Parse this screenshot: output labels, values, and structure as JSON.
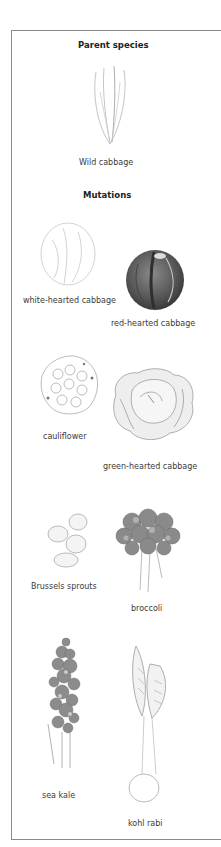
{
  "sections": {
    "parent_heading": "Parent species",
    "mutations_heading": "Mutations"
  },
  "parent": {
    "label": "Wild cabbage",
    "icon": "wild-cabbage-illustration"
  },
  "mutations": [
    {
      "label": "white-hearted cabbage",
      "icon": "white-cabbage-illustration"
    },
    {
      "label": "red-hearted cabbage",
      "icon": "red-cabbage-illustration"
    },
    {
      "label": "cauliflower",
      "icon": "cauliflower-illustration"
    },
    {
      "label": "green-hearted cabbage",
      "icon": "green-cabbage-illustration"
    },
    {
      "label": "Brussels sprouts",
      "icon": "brussels-sprouts-illustration"
    },
    {
      "label": "broccoli",
      "icon": "broccoli-illustration"
    },
    {
      "label": "sea kale",
      "icon": "sea-kale-illustration"
    },
    {
      "label": "kohl rabi",
      "icon": "kohl-rabi-illustration"
    }
  ],
  "colors": {
    "border": "#8a8a8a",
    "text": "#333333",
    "sketch": "#7a7a7a"
  }
}
